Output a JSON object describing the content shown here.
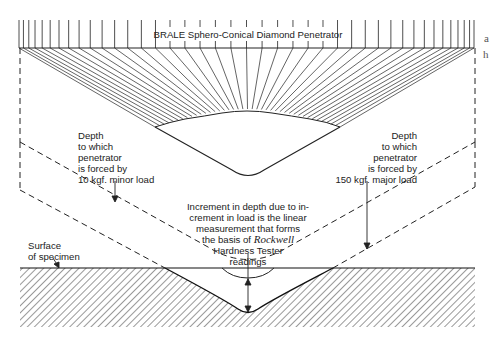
{
  "diagram": {
    "title": "BRALE Sphero-Conical Diamond Penetrator",
    "edge_text": [
      "a",
      "h"
    ],
    "labels": {
      "minor_load": [
        "Depth",
        "to which",
        "penetrator",
        "is forced by",
        "10 kgf. minor load"
      ],
      "major_load": [
        "Depth",
        "to which",
        "penetrator",
        "is forced by",
        "150 kgf. major load"
      ],
      "increment": [
        "Increment in depth due to in-",
        "crement in load is the linear",
        "measurement that forms",
        "the basis of ",
        "Hardness Tester",
        "readings"
      ],
      "increment_italic": "Rockwell",
      "surface": [
        "Surface",
        "of specimen"
      ]
    },
    "colors": {
      "line": "#1a1a1a",
      "background": "#ffffff"
    }
  }
}
